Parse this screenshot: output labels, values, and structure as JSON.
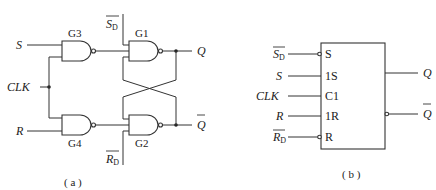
{
  "diagram_a": {
    "caption": "( a )",
    "gates": {
      "g1": "G1",
      "g2": "G2",
      "g3": "G3",
      "g4": "G4"
    },
    "inputs": {
      "s": "S",
      "clk": "CLK",
      "r": "R",
      "sd": "S",
      "sd_sub": "D",
      "rd": "R",
      "rd_sub": "D"
    },
    "outputs": {
      "q": "Q",
      "qbar": "Q"
    }
  },
  "diagram_b": {
    "caption": "( b )",
    "inputs": {
      "sd": "S",
      "sd_sub": "D",
      "s": "S",
      "clk": "CLK",
      "r": "R",
      "rd": "R",
      "rd_sub": "D"
    },
    "pins": {
      "s": "S",
      "one_s": "1S",
      "c1": "C1",
      "one_r": "1R",
      "r": "R"
    },
    "outputs": {
      "q": "Q",
      "qbar": "Q"
    }
  }
}
